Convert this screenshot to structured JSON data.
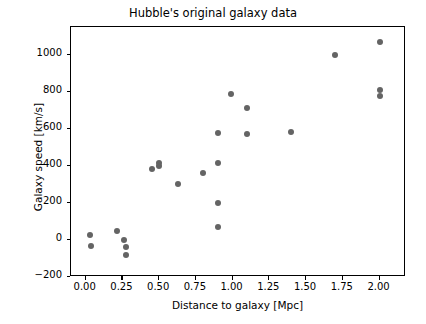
{
  "chart_data": {
    "type": "scatter",
    "title": "Hubble's original galaxy data",
    "xlabel": "Distance to galaxy [Mpc]",
    "ylabel": "Galaxy speed [km/s]",
    "xlim": [
      -0.1,
      2.18
    ],
    "ylim": [
      -200,
      1150
    ],
    "xticks": [
      0.0,
      0.25,
      0.5,
      0.75,
      1.0,
      1.25,
      1.5,
      1.75,
      2.0
    ],
    "xticklabels": [
      "0.00",
      "0.25",
      "0.50",
      "0.75",
      "1.00",
      "1.25",
      "1.50",
      "1.75",
      "2.00"
    ],
    "yticks": [
      -200,
      0,
      200,
      400,
      600,
      800,
      1000
    ],
    "yticklabels": [
      "−200",
      "0",
      "200",
      "400",
      "600",
      "800",
      "1000"
    ],
    "grid": false,
    "legend": false,
    "marker_color": "#646464",
    "marker_size": 6,
    "points": [
      {
        "x": 0.032,
        "y": 25
      },
      {
        "x": 0.034,
        "y": -35
      },
      {
        "x": 0.214,
        "y": 50
      },
      {
        "x": 0.263,
        "y": 0
      },
      {
        "x": 0.275,
        "y": -40
      },
      {
        "x": 0.275,
        "y": -80
      },
      {
        "x": 0.45,
        "y": 385
      },
      {
        "x": 0.5,
        "y": 400
      },
      {
        "x": 0.5,
        "y": 415
      },
      {
        "x": 0.63,
        "y": 300
      },
      {
        "x": 0.8,
        "y": 360
      },
      {
        "x": 0.9,
        "y": 575
      },
      {
        "x": 0.9,
        "y": 415
      },
      {
        "x": 0.9,
        "y": 200
      },
      {
        "x": 0.9,
        "y": 70
      },
      {
        "x": 0.99,
        "y": 790
      },
      {
        "x": 1.1,
        "y": 715
      },
      {
        "x": 1.1,
        "y": 570
      },
      {
        "x": 1.4,
        "y": 585
      },
      {
        "x": 1.7,
        "y": 1000
      },
      {
        "x": 2.0,
        "y": 1070
      },
      {
        "x": 2.0,
        "y": 810
      },
      {
        "x": 2.0,
        "y": 775
      }
    ]
  }
}
